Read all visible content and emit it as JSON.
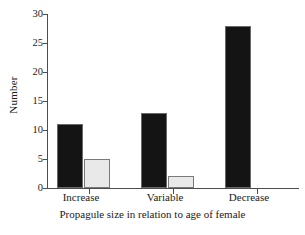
{
  "chart_data": {
    "type": "bar",
    "title": "",
    "subtitle": "",
    "xlabel": "Propagule size in relation to age of female",
    "ylabel": "Number",
    "categories": [
      "Increase",
      "Variable",
      "Decrease"
    ],
    "series": [
      {
        "name": "series-1",
        "color": "#141414",
        "values": [
          11,
          13,
          28
        ]
      },
      {
        "name": "series-2",
        "color": "#e9e9e9",
        "values": [
          5,
          2,
          0
        ]
      }
    ],
    "ylim": [
      0,
      30
    ],
    "yticks": [
      0,
      5,
      10,
      15,
      20,
      25,
      30
    ],
    "ytick_labels": [
      "0",
      "5",
      "10",
      "15",
      "20",
      "25",
      "30"
    ],
    "grid": false,
    "legend": "none",
    "axis_color": "#4d4d4d",
    "background": "#ffffff"
  }
}
